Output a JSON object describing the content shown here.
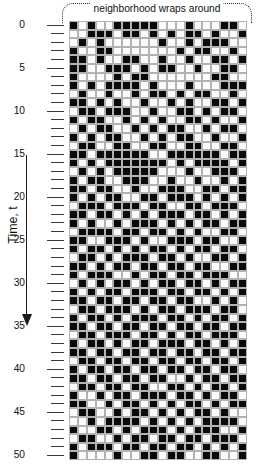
{
  "annotation": {
    "text": "neighborhood wraps around",
    "bracket_style": "dotted-rounded"
  },
  "axis": {
    "title": "Time, t",
    "arrow_direction": "down",
    "min": 0,
    "max": 50,
    "major_step": 5,
    "minor_step": 1,
    "major_labels": [
      "0",
      "5",
      "10",
      "15",
      "20",
      "25",
      "30",
      "35",
      "40",
      "45",
      "50"
    ]
  },
  "colors": {
    "cell_on": "#0a0a0a",
    "cell_off": "#fbfbfb",
    "gridline": "#b2b2b2",
    "ink": "#111111",
    "background": "#ffffff"
  },
  "chart_data": {
    "type": "heatmap",
    "title": "",
    "xlabel": "",
    "ylabel": "Time, t",
    "grid": true,
    "legend": "none",
    "columns": 20,
    "rows": 51,
    "value_labels": {
      "1": "alive (black)",
      "0": "dead (white)"
    },
    "annotations": [
      "neighborhood wraps around"
    ],
    "ylim": [
      0,
      50
    ],
    "yticks": [
      0,
      5,
      10,
      15,
      20,
      25,
      30,
      35,
      40,
      45,
      50
    ],
    "values": [
      [
        1,
        0,
        1,
        0,
        0,
        1,
        1,
        1,
        1,
        1,
        0,
        0,
        0,
        1,
        0,
        0,
        0,
        1,
        1,
        0
      ],
      [
        0,
        0,
        1,
        1,
        1,
        0,
        1,
        1,
        0,
        1,
        0,
        1,
        0,
        1,
        1,
        0,
        1,
        0,
        0,
        1
      ],
      [
        0,
        1,
        0,
        1,
        0,
        0,
        0,
        0,
        0,
        0,
        1,
        0,
        0,
        1,
        0,
        1,
        1,
        1,
        0,
        0
      ],
      [
        1,
        0,
        0,
        1,
        1,
        0,
        0,
        0,
        0,
        0,
        0,
        0,
        1,
        0,
        1,
        1,
        0,
        0,
        1,
        0
      ],
      [
        1,
        1,
        0,
        1,
        0,
        0,
        1,
        1,
        0,
        0,
        1,
        0,
        0,
        1,
        0,
        0,
        1,
        1,
        0,
        1
      ],
      [
        1,
        1,
        0,
        0,
        1,
        1,
        1,
        0,
        1,
        0,
        1,
        1,
        0,
        0,
        1,
        0,
        0,
        1,
        1,
        0
      ],
      [
        1,
        0,
        0,
        0,
        0,
        1,
        0,
        1,
        1,
        0,
        0,
        0,
        0,
        0,
        0,
        0,
        1,
        1,
        0,
        0
      ],
      [
        1,
        0,
        1,
        0,
        1,
        1,
        1,
        1,
        0,
        1,
        0,
        0,
        0,
        1,
        0,
        0,
        0,
        1,
        1,
        1
      ],
      [
        0,
        1,
        0,
        0,
        1,
        0,
        0,
        1,
        0,
        1,
        1,
        0,
        1,
        0,
        1,
        1,
        0,
        0,
        1,
        0
      ],
      [
        1,
        1,
        0,
        1,
        0,
        1,
        0,
        0,
        1,
        0,
        0,
        1,
        0,
        1,
        0,
        0,
        1,
        1,
        0,
        1
      ],
      [
        0,
        1,
        1,
        0,
        1,
        1,
        1,
        0,
        0,
        1,
        0,
        0,
        1,
        1,
        0,
        1,
        0,
        1,
        1,
        0
      ],
      [
        1,
        0,
        1,
        1,
        0,
        0,
        1,
        0,
        1,
        0,
        1,
        0,
        0,
        1,
        1,
        0,
        1,
        0,
        0,
        1
      ],
      [
        0,
        1,
        0,
        1,
        1,
        0,
        0,
        1,
        0,
        1,
        0,
        1,
        1,
        0,
        0,
        1,
        0,
        1,
        1,
        0
      ],
      [
        1,
        0,
        1,
        0,
        1,
        1,
        0,
        0,
        1,
        0,
        1,
        0,
        1,
        1,
        0,
        0,
        1,
        0,
        0,
        1
      ],
      [
        0,
        1,
        1,
        0,
        0,
        1,
        1,
        0,
        0,
        1,
        1,
        0,
        0,
        1,
        1,
        0,
        0,
        1,
        1,
        0
      ],
      [
        1,
        1,
        0,
        1,
        1,
        1,
        1,
        1,
        1,
        0,
        0,
        1,
        1,
        1,
        1,
        1,
        1,
        0,
        1,
        1
      ],
      [
        1,
        0,
        1,
        0,
        1,
        1,
        1,
        1,
        1,
        1,
        1,
        0,
        1,
        0,
        1,
        1,
        1,
        1,
        0,
        1
      ],
      [
        0,
        1,
        0,
        1,
        0,
        1,
        1,
        1,
        1,
        1,
        0,
        0,
        0,
        1,
        0,
        0,
        1,
        1,
        1,
        0
      ],
      [
        1,
        0,
        1,
        1,
        0,
        0,
        1,
        1,
        1,
        0,
        0,
        1,
        0,
        0,
        1,
        0,
        0,
        1,
        0,
        1
      ],
      [
        1,
        1,
        0,
        1,
        1,
        0,
        0,
        1,
        0,
        0,
        1,
        1,
        1,
        0,
        0,
        1,
        1,
        0,
        1,
        1
      ],
      [
        1,
        0,
        1,
        0,
        1,
        1,
        0,
        0,
        1,
        1,
        0,
        1,
        1,
        1,
        0,
        1,
        0,
        1,
        0,
        1
      ],
      [
        0,
        1,
        1,
        1,
        0,
        1,
        1,
        1,
        0,
        1,
        1,
        0,
        0,
        1,
        1,
        0,
        1,
        1,
        1,
        0
      ],
      [
        1,
        1,
        0,
        1,
        1,
        0,
        1,
        0,
        1,
        0,
        1,
        1,
        1,
        0,
        1,
        1,
        0,
        1,
        0,
        1
      ],
      [
        1,
        0,
        1,
        0,
        0,
        1,
        0,
        1,
        1,
        1,
        0,
        1,
        0,
        1,
        0,
        1,
        1,
        0,
        1,
        1
      ],
      [
        0,
        1,
        1,
        1,
        1,
        0,
        1,
        1,
        0,
        1,
        1,
        0,
        1,
        0,
        1,
        0,
        0,
        1,
        1,
        0
      ],
      [
        1,
        1,
        0,
        0,
        1,
        1,
        1,
        0,
        1,
        0,
        0,
        1,
        1,
        1,
        0,
        1,
        1,
        0,
        0,
        1
      ],
      [
        1,
        0,
        1,
        1,
        0,
        1,
        0,
        1,
        0,
        1,
        1,
        0,
        1,
        0,
        1,
        1,
        0,
        1,
        1,
        0
      ],
      [
        0,
        1,
        1,
        0,
        1,
        0,
        1,
        1,
        1,
        0,
        1,
        1,
        0,
        1,
        0,
        0,
        1,
        1,
        0,
        1
      ],
      [
        1,
        1,
        0,
        1,
        0,
        1,
        1,
        0,
        1,
        1,
        0,
        1,
        1,
        0,
        1,
        1,
        0,
        0,
        1,
        1
      ],
      [
        1,
        0,
        1,
        1,
        1,
        0,
        0,
        1,
        0,
        1,
        1,
        0,
        1,
        1,
        0,
        1,
        1,
        1,
        0,
        0
      ],
      [
        0,
        1,
        0,
        1,
        0,
        1,
        1,
        0,
        1,
        0,
        1,
        1,
        0,
        1,
        1,
        0,
        1,
        0,
        1,
        1
      ],
      [
        1,
        0,
        1,
        0,
        1,
        1,
        0,
        1,
        1,
        1,
        0,
        1,
        1,
        0,
        1,
        1,
        0,
        1,
        0,
        1
      ],
      [
        1,
        1,
        0,
        1,
        1,
        0,
        1,
        1,
        0,
        1,
        1,
        0,
        1,
        1,
        0,
        0,
        1,
        0,
        1,
        0
      ],
      [
        0,
        1,
        1,
        0,
        1,
        1,
        1,
        0,
        1,
        0,
        1,
        1,
        0,
        1,
        1,
        1,
        0,
        1,
        1,
        0
      ],
      [
        1,
        0,
        1,
        1,
        0,
        1,
        0,
        1,
        1,
        1,
        0,
        1,
        1,
        0,
        1,
        0,
        1,
        1,
        0,
        1
      ],
      [
        1,
        1,
        0,
        1,
        1,
        0,
        1,
        1,
        0,
        1,
        1,
        0,
        1,
        1,
        0,
        1,
        1,
        0,
        1,
        1
      ],
      [
        0,
        1,
        1,
        0,
        1,
        1,
        1,
        0,
        1,
        1,
        0,
        1,
        0,
        1,
        1,
        0,
        1,
        1,
        1,
        0
      ],
      [
        1,
        0,
        1,
        1,
        0,
        1,
        0,
        1,
        1,
        0,
        1,
        1,
        1,
        0,
        1,
        1,
        0,
        1,
        0,
        1
      ],
      [
        1,
        1,
        0,
        1,
        1,
        0,
        1,
        1,
        0,
        1,
        1,
        0,
        1,
        1,
        0,
        1,
        1,
        0,
        1,
        1
      ],
      [
        0,
        1,
        1,
        0,
        1,
        1,
        0,
        1,
        1,
        0,
        1,
        1,
        0,
        1,
        1,
        0,
        1,
        1,
        0,
        1
      ],
      [
        1,
        0,
        1,
        1,
        0,
        1,
        1,
        0,
        1,
        1,
        0,
        1,
        1,
        0,
        1,
        1,
        0,
        1,
        1,
        0
      ],
      [
        1,
        1,
        0,
        1,
        1,
        0,
        1,
        1,
        0,
        1,
        1,
        0,
        0,
        1,
        0,
        1,
        1,
        0,
        1,
        1
      ],
      [
        0,
        1,
        1,
        0,
        1,
        1,
        0,
        1,
        1,
        0,
        0,
        1,
        1,
        0,
        1,
        0,
        1,
        1,
        0,
        1
      ],
      [
        1,
        0,
        0,
        1,
        0,
        1,
        1,
        0,
        1,
        1,
        1,
        0,
        1,
        1,
        0,
        1,
        0,
        1,
        1,
        0
      ],
      [
        1,
        1,
        0,
        0,
        1,
        0,
        1,
        1,
        0,
        1,
        0,
        1,
        0,
        1,
        1,
        0,
        1,
        0,
        1,
        1
      ],
      [
        0,
        1,
        1,
        0,
        0,
        1,
        0,
        1,
        1,
        0,
        1,
        0,
        1,
        0,
        1,
        1,
        0,
        1,
        0,
        0
      ],
      [
        0,
        0,
        1,
        0,
        1,
        1,
        1,
        1,
        0,
        1,
        0,
        1,
        0,
        1,
        0,
        1,
        1,
        1,
        1,
        0
      ],
      [
        1,
        0,
        0,
        1,
        1,
        0,
        1,
        0,
        1,
        1,
        1,
        0,
        1,
        0,
        1,
        1,
        1,
        0,
        0,
        1
      ],
      [
        0,
        1,
        1,
        0,
        0,
        1,
        0,
        1,
        1,
        0,
        1,
        1,
        0,
        1,
        1,
        0,
        1,
        1,
        1,
        0
      ],
      [
        1,
        0,
        1,
        1,
        1,
        0,
        1,
        1,
        0,
        1,
        1,
        0,
        1,
        1,
        0,
        1,
        0,
        1,
        0,
        1
      ],
      [
        1,
        0,
        0,
        0,
        0,
        1,
        0,
        0,
        1,
        1,
        0,
        1,
        1,
        0,
        0,
        1,
        1,
        0,
        0,
        1
      ]
    ]
  }
}
